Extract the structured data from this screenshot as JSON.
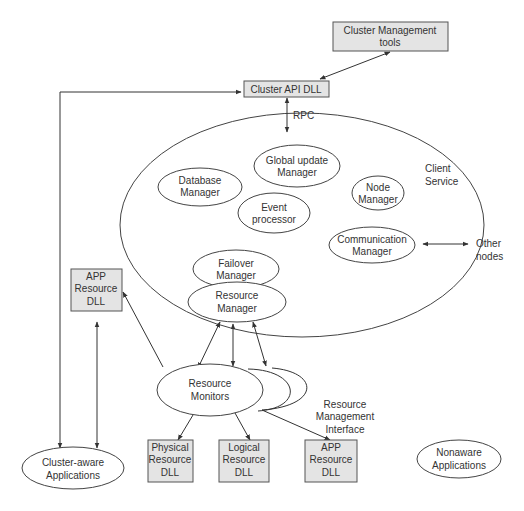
{
  "diagram": {
    "boxes": {
      "cluster_mgmt_tools": [
        "Cluster Management",
        "tools"
      ],
      "cluster_api_dll": [
        "Cluster API DLL"
      ],
      "app_resource_dll_left": [
        "APP",
        "Resource",
        "DLL"
      ],
      "physical_resource_dll": [
        "Physical",
        "Resource",
        "DLL"
      ],
      "logical_resource_dll": [
        "Logical",
        "Resource",
        "DLL"
      ],
      "app_resource_dll_bottom": [
        "APP",
        "Resource",
        "DLL"
      ]
    },
    "ellipses": {
      "global_update_manager": [
        "Global update",
        "Manager"
      ],
      "database_manager": [
        "Database",
        "Manager"
      ],
      "node_manager": [
        "Node",
        "Manager"
      ],
      "event_processor": [
        "Event",
        "processor"
      ],
      "communication_manager": [
        "Communication",
        "Manager"
      ],
      "failover_manager": [
        "Failover",
        "Manager"
      ],
      "resource_manager": [
        "Resource",
        "Manager"
      ],
      "resource_monitors": [
        "Resource",
        "Monitors"
      ],
      "cluster_aware_apps": [
        "Cluster-aware",
        "Applications"
      ],
      "nonaware_apps": [
        "Nonaware",
        "Applications"
      ]
    },
    "labels": {
      "rpc": "RPC",
      "client_service": [
        "Client",
        "Service"
      ],
      "other_nodes": [
        "Other",
        "nodes"
      ],
      "resource_mgmt_interface": [
        "Resource",
        "Management",
        "Interface"
      ]
    }
  }
}
